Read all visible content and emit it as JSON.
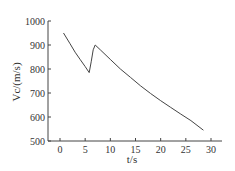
{
  "chart_data": {
    "type": "line",
    "title": "",
    "xlabel": "t/s",
    "ylabel": "Vc/(m/s)",
    "xlim": [
      -2.5,
      32
    ],
    "ylim": [
      500,
      1000
    ],
    "x_ticks": [
      0,
      5,
      10,
      15,
      20,
      25,
      30
    ],
    "y_ticks": [
      500,
      600,
      700,
      800,
      900,
      1000
    ],
    "grid": false,
    "legend": null,
    "series": [
      {
        "name": "Vc",
        "x": [
          0.7,
          2,
          3,
          4,
          5,
          5.8,
          6.2,
          6.6,
          7.0,
          8,
          10,
          12,
          14,
          16,
          18,
          20,
          22,
          24,
          26,
          28.5
        ],
        "y": [
          950,
          905,
          870,
          840,
          810,
          785,
          830,
          880,
          900,
          880,
          840,
          800,
          765,
          730,
          698,
          668,
          640,
          612,
          585,
          545
        ]
      }
    ]
  }
}
